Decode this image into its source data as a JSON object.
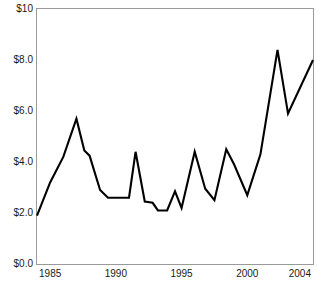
{
  "chart_data": {
    "type": "line",
    "title": "",
    "xlabel": "",
    "ylabel": "",
    "xlim": [
      1984,
      2005
    ],
    "ylim": [
      0,
      10
    ],
    "grid": false,
    "legend": null,
    "line_color": "#000000",
    "frame_color": "#9a9a9a",
    "background": "#ffffff",
    "y_tick_labels": [
      "$10",
      "$8.0",
      "$6.0",
      "$4.0",
      "$2.0",
      "$0.0"
    ],
    "y_tick_values": [
      10,
      8,
      6,
      4,
      2,
      0
    ],
    "x_tick_labels": [
      "1985",
      "1990",
      "1995",
      "2000",
      "2004"
    ],
    "x_tick_values": [
      1985,
      1990,
      1995,
      2000,
      2004
    ],
    "x": [
      1984,
      1985,
      1986,
      1987,
      1988,
      1989,
      1990,
      1991,
      1992,
      1993,
      1994,
      1995,
      1996,
      1997,
      1998,
      1999,
      2000,
      2001,
      2002,
      2003,
      2004,
      2005
    ],
    "values": [
      1.9,
      3.2,
      4.2,
      5.7,
      4.3,
      2.9,
      2.6,
      2.6,
      4.4,
      2.4,
      2.1,
      2.85,
      2.2,
      3.4,
      4.4,
      2.9,
      2.5,
      4.5,
      3.6,
      2.7,
      4.2,
      8.4
    ],
    "series": [
      {
        "name": "price",
        "values": [
          1.9,
          3.2,
          4.2,
          5.7,
          4.3,
          2.9,
          2.6,
          2.6,
          4.4,
          2.4,
          2.1,
          2.85,
          2.2,
          3.4,
          4.4,
          2.9,
          2.5,
          4.5,
          3.6,
          2.7,
          4.2,
          8.4
        ]
      }
    ],
    "points": [
      {
        "x": 1984.0,
        "y": 1.9
      },
      {
        "x": 1985.0,
        "y": 3.2
      },
      {
        "x": 1986.0,
        "y": 4.2
      },
      {
        "x": 1987.0,
        "y": 5.7
      },
      {
        "x": 1987.6,
        "y": 4.45
      },
      {
        "x": 1988.0,
        "y": 4.25
      },
      {
        "x": 1988.8,
        "y": 2.9
      },
      {
        "x": 1989.4,
        "y": 2.6
      },
      {
        "x": 1991.0,
        "y": 2.6
      },
      {
        "x": 1991.5,
        "y": 4.4
      },
      {
        "x": 1992.2,
        "y": 2.45
      },
      {
        "x": 1992.8,
        "y": 2.4
      },
      {
        "x": 1993.2,
        "y": 2.1
      },
      {
        "x": 1993.9,
        "y": 2.1
      },
      {
        "x": 1994.5,
        "y": 2.85
      },
      {
        "x": 1995.0,
        "y": 2.2
      },
      {
        "x": 1996.0,
        "y": 4.4
      },
      {
        "x": 1996.8,
        "y": 2.95
      },
      {
        "x": 1997.5,
        "y": 2.5
      },
      {
        "x": 1998.4,
        "y": 4.5
      },
      {
        "x": 1999.0,
        "y": 3.9
      },
      {
        "x": 2000.0,
        "y": 2.7
      },
      {
        "x": 2001.0,
        "y": 4.3
      },
      {
        "x": 2002.3,
        "y": 8.4
      },
      {
        "x": 2003.1,
        "y": 5.9
      },
      {
        "x": 2005.0,
        "y": 8.0
      }
    ]
  }
}
